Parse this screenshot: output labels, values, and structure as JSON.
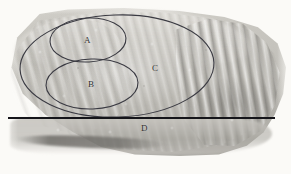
{
  "figure": {
    "kind": "annotated-grayscale-specimen-photograph",
    "width_px": 291,
    "height_px": 174,
    "background_color": "#fbfaf7"
  },
  "annotations": {
    "line_color": "#3a3a42",
    "label_color": "#2e2e2e",
    "regions": [
      {
        "id": "region-a",
        "label": "A",
        "shape": "ellipse",
        "cx": 88,
        "cy": 40,
        "rx": 38,
        "ry": 22,
        "rotation_deg": -3,
        "label_x": 84,
        "label_y": 36
      },
      {
        "id": "region-b",
        "label": "B",
        "shape": "ellipse",
        "cx": 92,
        "cy": 84,
        "rx": 46,
        "ry": 25,
        "rotation_deg": -2,
        "label_x": 88,
        "label_y": 80
      },
      {
        "id": "region-c",
        "label": "C",
        "shape": "ellipse",
        "cx": 117,
        "cy": 66,
        "rx": 97,
        "ry": 51,
        "rotation_deg": -2,
        "label_x": 152,
        "label_y": 64
      },
      {
        "id": "region-d",
        "label": "D",
        "shape": "horizontal-line",
        "x1": 8,
        "y1": 118,
        "x2": 275,
        "y2": 118,
        "stroke_width": 2,
        "stroke_color": "#15151a",
        "label_x": 141,
        "label_y": 124
      }
    ]
  }
}
